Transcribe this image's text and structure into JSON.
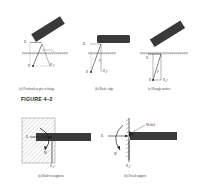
{
  "figure": {
    "title": "FIGURE 4–2",
    "top_row": [
      {
        "id": "a",
        "caption": "(a) Frictionless pin or hinge",
        "labels": [
          "Rx",
          "Ry",
          "R"
        ]
      },
      {
        "id": "b",
        "caption": "(b) Knife edge",
        "labels": [
          "Rx",
          "Ry",
          "R",
          "θ"
        ]
      },
      {
        "id": "c",
        "caption": "(c) Rough surface",
        "labels": [
          "Rx",
          "Ry",
          "R",
          "θ"
        ]
      }
    ],
    "bottom_row": [
      {
        "id": "a",
        "caption": "(a) Built-in supports",
        "labels": [
          "Rx",
          "Ry",
          "M"
        ]
      },
      {
        "id": "b",
        "caption": "(b) Fixed support",
        "labels": [
          "Rx",
          "Ry",
          "M",
          "Welded"
        ]
      }
    ]
  },
  "labels": {
    "rx": "R",
    "rx_sub": "x",
    "ry": "R",
    "ry_sub": "y",
    "r": "R",
    "m": "M",
    "theta": "θ",
    "welded": "Welded"
  },
  "colors": {
    "beam": "#3a3a3a",
    "hatch": "#888888",
    "line": "#444444",
    "wall_fill": "#d8d8d8"
  }
}
